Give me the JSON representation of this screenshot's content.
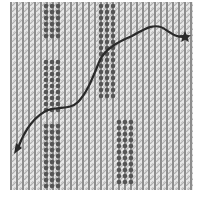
{
  "figure": {
    "background_color": "#ffffff",
    "grid_light_color": "#d8d8d8",
    "grid_mid_color": "#9a9a9a",
    "grid_dark_color": "#5a5a5a",
    "dot_color": "#555555",
    "path_color": "#2a2a2a",
    "path": {
      "start_marker": "arrowhead-icon",
      "end_marker": "star-icon"
    },
    "dot_bands": [
      {
        "name": "band-left-top"
      },
      {
        "name": "band-left-middle"
      },
      {
        "name": "band-left-bottom"
      },
      {
        "name": "band-center-top"
      },
      {
        "name": "band-center-bottom"
      }
    ]
  }
}
